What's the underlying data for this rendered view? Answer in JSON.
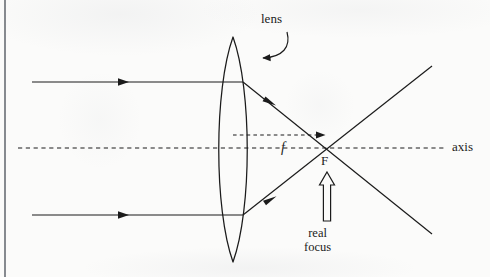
{
  "figure": {
    "type": "optics-ray-diagram",
    "background_color": "#fbfbfa",
    "ink_color": "#1b1b1b"
  },
  "labels": {
    "lens": "lens",
    "axis": "axis",
    "focal_point": "F",
    "focal_length": "f",
    "real_focus_line1": "real",
    "real_focus_line2": "focus"
  },
  "geometry": {
    "frame_left_x": 5,
    "lens_center_x": 233,
    "lens_top_y": 37,
    "lens_bottom_y": 262,
    "lens_bulge": 16,
    "axis_y": 148,
    "axis_start_x": 18,
    "axis_end_x": 447,
    "focal_point_x": 327,
    "focal_point_y": 148,
    "incident_ray_top_y": 82,
    "incident_ray_bottom_y": 215,
    "incident_ray_start_x": 32,
    "focal_dashed_y": 135
  },
  "elements": [
    {
      "name": "incident-ray-upper",
      "description": "horizontal ray entering lens above axis, arrowhead midway"
    },
    {
      "name": "incident-ray-lower",
      "description": "horizontal ray entering lens below axis, arrowhead midway"
    },
    {
      "name": "refracted-ray-upper",
      "description": "ray bending down through F and continuing to lower right"
    },
    {
      "name": "refracted-ray-lower",
      "description": "ray bending up through F and continuing to upper right"
    },
    {
      "name": "optical-axis",
      "description": "dashed horizontal centre line"
    },
    {
      "name": "focal-length-indicator",
      "description": "dashed segment from lens to F marked f"
    },
    {
      "name": "real-focus-pointer",
      "description": "hollow outlined arrow pointing up at F"
    },
    {
      "name": "lens-callout-arrow",
      "description": "curved arrow from the word lens to the lens apex"
    }
  ]
}
